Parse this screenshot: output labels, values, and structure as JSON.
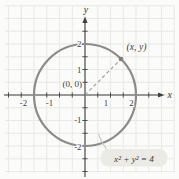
{
  "figure": {
    "colors": {
      "background": "#fbfbf9",
      "grid": "#e3e6e1",
      "axis": "#404040",
      "circle": "#8b8b8b",
      "dashed": "#9a9a9a",
      "point": "#7d7d7d",
      "text": "#3a3a3a",
      "pill": "#ebebe6",
      "callout": "#c9c9c3"
    },
    "labels": {
      "x_axis": "x",
      "y_axis": "y",
      "origin": "(0, 0)",
      "point": "(x, y)",
      "equation": "x² + y² = 4"
    },
    "axes": {
      "x_ticks": [
        "-2",
        "-1",
        "1",
        "2"
      ],
      "y_ticks": [
        "2",
        "1",
        "-1",
        "-2"
      ]
    },
    "geometry": {
      "type": "circle",
      "center": [
        0,
        0
      ],
      "radius": 2,
      "equation": "x² + y² = 4",
      "point_on_circle_quadrant": 1,
      "radius_line_angle_deg": 45
    }
  }
}
